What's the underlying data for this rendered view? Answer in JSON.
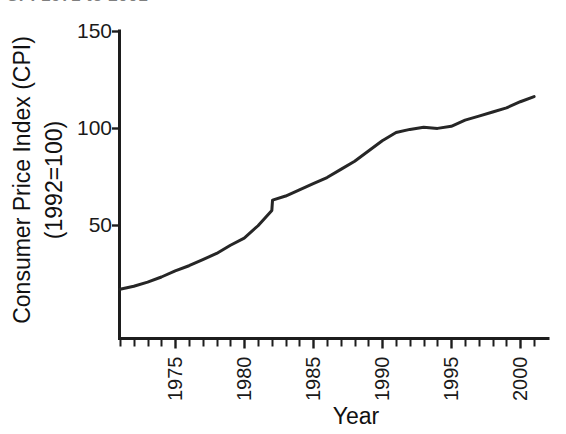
{
  "figure": {
    "clipped_title": "CPI 1971 to 2001",
    "background_color": "#ffffff",
    "line_color": "#262626",
    "axis_color": "#1d1d1d"
  },
  "chart_data": {
    "type": "line",
    "title": "",
    "xlabel": "Year",
    "ylabel_line1": "Consumer Price Index (CPI)",
    "ylabel_line2": "(1992=100)",
    "grid": false,
    "legend": false,
    "xlim": [
      1971,
      2001.5
    ],
    "ylim": [
      0,
      150
    ],
    "yticks": [
      50,
      100,
      150
    ],
    "ytick_labels": [
      "50",
      "100",
      "150"
    ],
    "xticks": [
      1971,
      1972,
      1973,
      1974,
      1975,
      1976,
      1977,
      1978,
      1979,
      1980,
      1981,
      1982,
      1983,
      1984,
      1985,
      1986,
      1987,
      1988,
      1989,
      1990,
      1991,
      1992,
      1993,
      1994,
      1995,
      1996,
      1997,
      1998,
      1999,
      2000,
      2001
    ],
    "xtick_labels": [
      "1975",
      "1980",
      "1985",
      "1990",
      "1995",
      "2000"
    ],
    "xtick_label_years": [
      1975,
      1980,
      1985,
      1990,
      1995,
      2000
    ],
    "xtick_label_rotation": -90,
    "series": [
      {
        "name": "Consumer Price Index (1992=100)",
        "x": [
          1971,
          1972,
          1973,
          1974,
          1975,
          1976,
          1977,
          1978,
          1979,
          1980,
          1981,
          1982,
          1982.05,
          1983,
          1984,
          1985,
          1986,
          1987,
          1988,
          1989,
          1990,
          1991,
          1992,
          1993,
          1994,
          1995,
          1996,
          1997,
          1998,
          1999,
          2000,
          2001
        ],
        "y": [
          24.0,
          25.5,
          27.5,
          30.0,
          33.0,
          35.5,
          38.5,
          41.5,
          45.5,
          49.0,
          55.0,
          62.5,
          67.5,
          69.5,
          72.5,
          75.5,
          78.5,
          82.5,
          86.5,
          91.5,
          96.5,
          100.5,
          102.0,
          103.0,
          102.5,
          103.5,
          106.5,
          108.5,
          110.5,
          112.5,
          115.5,
          118.0
        ]
      }
    ],
    "annotations": [
      {
        "label": "step jump",
        "year": 1982,
        "value": 67.5
      }
    ]
  }
}
